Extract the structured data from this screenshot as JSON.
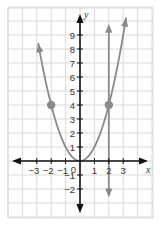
{
  "chart_data": {
    "type": "line",
    "title": "",
    "xlabel": "x",
    "ylabel": "y",
    "xlim": [
      -4.5,
      5.1
    ],
    "ylim": [
      -4,
      10.8
    ],
    "grid": true,
    "x_ticks": [
      -3,
      -2,
      -1,
      1,
      2,
      3
    ],
    "x_tick_labels": [
      "−3",
      "−2",
      "−1",
      "1",
      "2",
      "3"
    ],
    "y_ticks": [
      -2,
      -1,
      1,
      2,
      3,
      4,
      5,
      6,
      7,
      8,
      9
    ],
    "y_tick_labels": [
      "2",
      "1",
      "1",
      "2",
      "3",
      "4",
      "5",
      "6",
      "7",
      "8",
      "9"
    ],
    "origin_label": "0",
    "series": [
      {
        "name": "parabola y = x^2",
        "kind": "curve",
        "x_range": [
          -2.9,
          3.2
        ],
        "color": "#8a8a8a",
        "arrows": "both-ends"
      },
      {
        "name": "vertical line x = 2",
        "kind": "vertical",
        "x": 2,
        "y_range": [
          -2.6,
          9.8
        ],
        "color": "#8a8a8a",
        "arrows": "both-ends"
      }
    ],
    "points": [
      {
        "x": -2,
        "y": 4
      },
      {
        "x": 2,
        "y": 4
      }
    ],
    "colors": {
      "grid": "#d9d9d9",
      "axis": "#111111",
      "curve": "#8a8a8a",
      "point": "#8a8a8a"
    }
  }
}
